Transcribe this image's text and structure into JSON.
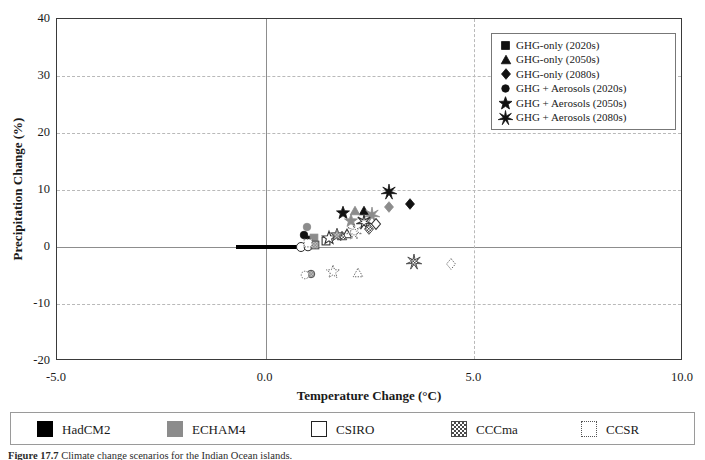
{
  "figure": {
    "number": "Figure 17.7",
    "caption": "Climate change scenarios for the Indian Ocean islands."
  },
  "chart_data": {
    "type": "scatter",
    "title": "",
    "xlabel": "Temperature Change (°C)",
    "ylabel": "Precipitation Change (%)",
    "xlim": [
      -5.0,
      10.0
    ],
    "ylim": [
      -20,
      40
    ],
    "xticks": [
      -5.0,
      0.0,
      5.0,
      10.0
    ],
    "xtick_labels": [
      "-5.0",
      "0.0",
      "5.0",
      "10.0"
    ],
    "yticks": [
      -20,
      -10,
      0,
      10,
      20,
      30,
      40
    ],
    "ytick_labels": [
      "-20",
      "-10",
      "0",
      "10",
      "20",
      "30",
      "40"
    ],
    "grid": "dashed horizontal at y = -10, 10, 20, 30; dashed vertical at x = 5.0; solid axis lines at x = 0 and y = 0",
    "legend_position": "upper right, inside plot",
    "baseline_bar": {
      "label": "HadCM2 baseline range",
      "x_start": -0.7,
      "x_end": 0.85,
      "y": 0.0,
      "end_marker": "open circle"
    },
    "marker_legend": [
      {
        "key": "ghg_2020",
        "shape": "square",
        "label": "GHG-only (2020s)"
      },
      {
        "key": "ghg_2050",
        "shape": "triangle",
        "label": "GHG-only (2050s)"
      },
      {
        "key": "ghg_2080",
        "shape": "diamond",
        "label": "GHG-only (2080s)"
      },
      {
        "key": "aer_2020",
        "shape": "circle",
        "label": "GHG + Aerosols (2020s)"
      },
      {
        "key": "aer_2050",
        "shape": "star",
        "label": "GHG + Aerosols (2050s)"
      },
      {
        "key": "aer_2080",
        "shape": "burst",
        "label": "GHG + Aerosols (2080s)"
      }
    ],
    "model_legend": [
      {
        "key": "hadcm2",
        "label": "HadCM2",
        "style": "solid-black"
      },
      {
        "key": "echam4",
        "label": "ECHAM4",
        "style": "solid-gray"
      },
      {
        "key": "csiro",
        "label": "CSIRO",
        "style": "outline"
      },
      {
        "key": "cccma",
        "label": "CCCma",
        "style": "checkered"
      },
      {
        "key": "ccsr",
        "label": "CCSR",
        "style": "dotted"
      }
    ],
    "series": [
      {
        "name": "HadCM2",
        "style": "solid-black",
        "points": [
          {
            "shape": "square",
            "x": 1.05,
            "y": 1.4,
            "period": "2020s"
          },
          {
            "shape": "triangle",
            "x": 2.35,
            "y": 6.3,
            "period": "2050s"
          },
          {
            "shape": "diamond",
            "x": 3.45,
            "y": 7.6,
            "period": "2080s"
          },
          {
            "shape": "circle",
            "x": 0.92,
            "y": 2.3,
            "period": "2020s"
          },
          {
            "shape": "star",
            "x": 1.85,
            "y": 5.9,
            "period": "2050s"
          },
          {
            "shape": "burst",
            "x": 2.95,
            "y": 9.7,
            "period": "2080s"
          }
        ]
      },
      {
        "name": "ECHAM4",
        "style": "solid-gray",
        "points": [
          {
            "shape": "square",
            "x": 1.15,
            "y": 1.8,
            "period": "2020s"
          },
          {
            "shape": "triangle",
            "x": 2.15,
            "y": 6.4,
            "period": "2050s"
          },
          {
            "shape": "diamond",
            "x": 2.95,
            "y": 7.1,
            "period": "2080s"
          },
          {
            "shape": "circle",
            "x": 0.98,
            "y": 3.6,
            "period": "2020s"
          },
          {
            "shape": "star",
            "x": 2.05,
            "y": 4.5,
            "period": "2050s"
          },
          {
            "shape": "burst",
            "x": 2.55,
            "y": 5.6,
            "period": "2080s"
          }
        ]
      },
      {
        "name": "CSIRO",
        "style": "outline",
        "points": [
          {
            "shape": "square",
            "x": 1.45,
            "y": 1.2,
            "period": "2020s"
          },
          {
            "shape": "triangle",
            "x": 1.95,
            "y": 2.3,
            "period": "2050s"
          },
          {
            "shape": "diamond",
            "x": 2.65,
            "y": 4.1,
            "period": "2080s"
          },
          {
            "shape": "circle",
            "x": 1.02,
            "y": 0.1,
            "period": "2020s"
          },
          {
            "shape": "star",
            "x": 1.52,
            "y": 1.6,
            "period": "2050s"
          },
          {
            "shape": "burst",
            "x": 2.35,
            "y": 4.4,
            "period": "2080s"
          }
        ]
      },
      {
        "name": "CCCma",
        "style": "checkered",
        "points": [
          {
            "shape": "square",
            "x": 1.18,
            "y": 0.6,
            "period": "2020s"
          },
          {
            "shape": "triangle",
            "x": 1.82,
            "y": 1.9,
            "period": "2050s"
          },
          {
            "shape": "diamond",
            "x": 2.48,
            "y": 3.2,
            "period": "2080s"
          },
          {
            "shape": "circle",
            "x": 1.08,
            "y": -4.6,
            "period": "2020s"
          },
          {
            "shape": "star",
            "x": 1.72,
            "y": 2.1,
            "period": "2050s"
          },
          {
            "shape": "burst",
            "x": 3.55,
            "y": -2.6,
            "period": "2080s"
          }
        ]
      },
      {
        "name": "CCSR",
        "style": "dotted",
        "points": [
          {
            "shape": "square",
            "x": 1.02,
            "y": 0.9,
            "period": "2020s"
          },
          {
            "shape": "triangle",
            "x": 2.22,
            "y": -4.5,
            "period": "2050s"
          },
          {
            "shape": "diamond",
            "x": 4.45,
            "y": -2.9,
            "period": "2080s"
          },
          {
            "shape": "circle",
            "x": 0.95,
            "y": -4.7,
            "period": "2020s"
          },
          {
            "shape": "star",
            "x": 1.62,
            "y": -4.4,
            "period": "2050s"
          },
          {
            "shape": "burst",
            "x": 2.12,
            "y": 2.6,
            "period": "2080s"
          }
        ]
      }
    ]
  }
}
